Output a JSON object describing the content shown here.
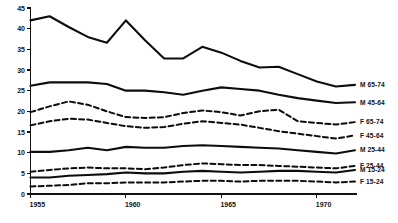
{
  "chart_data": {
    "type": "line",
    "title": "",
    "subtitle": "",
    "xlabel": "",
    "ylabel": "",
    "xlim": [
      1955,
      1972
    ],
    "ylim": [
      0,
      45
    ],
    "grid": false,
    "legend_position": "right-inline-at-line-ends",
    "x_tick_labels": [
      "1955",
      "1960",
      "1965",
      "1970"
    ],
    "x_tick_values": [
      1955,
      1960,
      1965,
      1970
    ],
    "y_tick_labels": [
      "0",
      "5",
      "10",
      "15",
      "20",
      "25",
      "30",
      "35",
      "40",
      "45"
    ],
    "y_tick_values": [
      0,
      5,
      10,
      15,
      20,
      25,
      30,
      35,
      40,
      45
    ],
    "x": [
      1955,
      1956,
      1957,
      1958,
      1959,
      1960,
      1961,
      1962,
      1963,
      1964,
      1965,
      1966,
      1967,
      1968,
      1969,
      1970,
      1971,
      1972
    ],
    "series": [
      {
        "name": "M 65-74",
        "label": "M 65-74",
        "style": "solid",
        "values": [
          42.0,
          43.0,
          40.4,
          38.0,
          36.6,
          42.0,
          37.2,
          32.8,
          32.8,
          35.6,
          34.2,
          32.2,
          30.6,
          30.8,
          29.0,
          27.2,
          26.0,
          26.4
        ]
      },
      {
        "name": "M 45-64",
        "label": "M 45-64",
        "style": "solid",
        "values": [
          26.2,
          27.0,
          27.0,
          27.0,
          26.6,
          25.0,
          25.0,
          24.6,
          24.0,
          25.0,
          25.8,
          25.4,
          25.0,
          24.0,
          23.2,
          22.6,
          22.0,
          22.2
        ]
      },
      {
        "name": "F 65-74",
        "label": "F 65-74",
        "style": "dashed",
        "values": [
          19.8,
          21.2,
          22.4,
          21.6,
          20.0,
          18.6,
          18.4,
          18.6,
          19.6,
          20.2,
          19.8,
          19.0,
          20.0,
          20.4,
          17.6,
          17.2,
          16.8,
          17.4
        ]
      },
      {
        "name": "F 45-64",
        "label": "F 45-64",
        "style": "dashed",
        "values": [
          16.6,
          17.6,
          18.2,
          18.0,
          17.2,
          16.4,
          16.0,
          16.2,
          17.0,
          17.6,
          17.2,
          16.8,
          16.0,
          15.2,
          14.6,
          14.0,
          13.4,
          14.2
        ]
      },
      {
        "name": "M 25-44",
        "label": "M 25-44",
        "style": "solid",
        "values": [
          10.2,
          10.2,
          10.6,
          11.2,
          10.6,
          11.4,
          11.2,
          11.2,
          11.6,
          11.8,
          11.6,
          11.4,
          11.2,
          11.0,
          10.6,
          10.2,
          9.8,
          10.6
        ]
      },
      {
        "name": "F 25-44",
        "label": "F 25-44",
        "style": "dashed",
        "values": [
          5.4,
          5.8,
          6.2,
          6.4,
          6.2,
          6.2,
          6.0,
          6.4,
          7.0,
          7.4,
          7.2,
          7.0,
          7.0,
          6.8,
          6.6,
          6.4,
          6.2,
          6.8
        ]
      },
      {
        "name": "M 15-24",
        "label": "M 15-24",
        "style": "solid",
        "values": [
          4.0,
          4.0,
          4.4,
          4.6,
          4.8,
          5.2,
          5.0,
          5.0,
          5.4,
          5.6,
          5.4,
          5.2,
          5.4,
          5.6,
          5.6,
          5.4,
          5.2,
          5.8
        ]
      },
      {
        "name": "F 15-24",
        "label": "F 15-24",
        "style": "dashed",
        "values": [
          1.8,
          2.0,
          2.2,
          2.6,
          2.6,
          2.8,
          2.8,
          2.8,
          3.0,
          3.2,
          3.2,
          3.0,
          3.2,
          3.2,
          3.2,
          3.0,
          2.8,
          3.0
        ]
      }
    ]
  },
  "legend": {
    "entries": [
      {
        "label": "M 65-74"
      },
      {
        "label": "M 45-64"
      },
      {
        "label": "F 65-74"
      },
      {
        "label": "F 45-64"
      },
      {
        "label": "M 25-44"
      },
      {
        "label": "F 25-44"
      },
      {
        "label": "M 15-24"
      },
      {
        "label": "F 15-24"
      }
    ]
  }
}
